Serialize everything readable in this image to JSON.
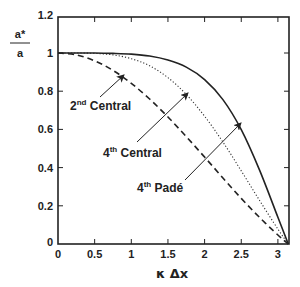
{
  "chart_data": {
    "type": "line",
    "title": "",
    "xlabel": "κ Δx",
    "ylabel_numerator": "a*",
    "ylabel_denominator": "a",
    "xlim": [
      0,
      3.1416
    ],
    "ylim": [
      0,
      1.2
    ],
    "xticks": [
      "0",
      "0.5",
      "1",
      "1.5",
      "2",
      "2.5",
      "3"
    ],
    "xtick_values": [
      0,
      0.5,
      1,
      1.5,
      2,
      2.5,
      3
    ],
    "yticks": [
      "0",
      "0.2",
      "0.4",
      "0.6",
      "0.8",
      "1",
      "1.2"
    ],
    "ytick_values": [
      0,
      0.2,
      0.4,
      0.6,
      0.8,
      1.0,
      1.2
    ],
    "grid": false,
    "legend": "annotations with arrows",
    "x": [
      0,
      0.25,
      0.5,
      0.75,
      1.0,
      1.25,
      1.5,
      1.75,
      2.0,
      2.25,
      2.5,
      2.75,
      3.0,
      3.1416
    ],
    "series": [
      {
        "name": "2nd Central",
        "style": "dashed",
        "values": [
          1.0,
          0.99,
          0.959,
          0.909,
          0.841,
          0.759,
          0.665,
          0.562,
          0.455,
          0.346,
          0.239,
          0.139,
          0.047,
          0.0
        ]
      },
      {
        "name": "4th Central",
        "style": "dotted",
        "values": [
          1.0,
          1.0,
          0.998,
          0.99,
          0.97,
          0.933,
          0.871,
          0.783,
          0.669,
          0.534,
          0.383,
          0.228,
          0.078,
          0.0
        ]
      },
      {
        "name": "4th Padé",
        "style": "solid",
        "values": [
          1.0,
          1.0,
          1.0,
          0.998,
          0.994,
          0.984,
          0.963,
          0.926,
          0.861,
          0.756,
          0.599,
          0.387,
          0.14,
          0.0
        ]
      }
    ],
    "annotations": [
      {
        "base": "2",
        "sup": "nd",
        "rest": " Central",
        "series": "2nd Central"
      },
      {
        "base": "4",
        "sup": "th",
        "rest": " Central",
        "series": "4th Central"
      },
      {
        "base": "4",
        "sup": "th",
        "rest": " Padé",
        "series": "4th Padé"
      }
    ]
  }
}
